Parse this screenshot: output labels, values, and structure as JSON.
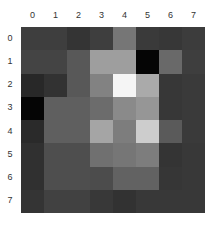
{
  "chart_data": {
    "type": "heatmap",
    "title": "",
    "xlabel": "",
    "ylabel": "",
    "x_ticks": [
      "0",
      "1",
      "2",
      "3",
      "4",
      "5",
      "6",
      "7"
    ],
    "y_ticks": [
      "0",
      "1",
      "2",
      "3",
      "4",
      "5",
      "6",
      "7"
    ],
    "x_axis_position": "top",
    "colormap": "gray",
    "value_range": [
      0,
      255
    ],
    "grid": false,
    "legend": null,
    "values": [
      [
        62,
        62,
        52,
        62,
        118,
        58,
        55,
        60
      ],
      [
        68,
        68,
        88,
        158,
        158,
        5,
        105,
        62
      ],
      [
        40,
        50,
        88,
        130,
        245,
        170,
        55,
        58
      ],
      [
        5,
        95,
        95,
        108,
        138,
        150,
        55,
        58
      ],
      [
        42,
        95,
        95,
        165,
        125,
        205,
        90,
        58
      ],
      [
        48,
        78,
        78,
        112,
        118,
        125,
        52,
        56
      ],
      [
        48,
        78,
        78,
        76,
        98,
        98,
        54,
        56
      ],
      [
        52,
        65,
        65,
        56,
        50,
        56,
        56,
        56
      ]
    ]
  }
}
